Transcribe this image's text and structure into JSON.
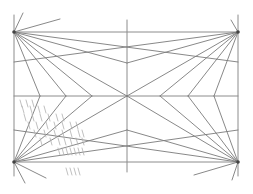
{
  "diagram": {
    "title": "",
    "vanishing_points": [
      "top-left",
      "top-right",
      "bottom-left",
      "bottom-right"
    ],
    "fan_line_count_per_corner": 6,
    "has_center_cross": true,
    "hatched_region": "lower-left quadrant",
    "colors": {
      "line": "#7a7a7a",
      "frame": "#8c8c8c",
      "hatch": "#b0b0b0",
      "background": "#ffffff"
    }
  }
}
